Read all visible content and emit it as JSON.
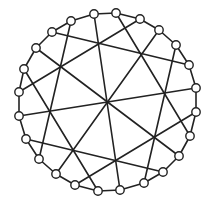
{
  "diagram": {
    "type": "circular-graph",
    "colors": {
      "stroke": "#222222",
      "node_fill": "#ffffff",
      "background": "#ffffff"
    },
    "node_radius": 4.2,
    "ring_nodes": [
      [
        94,
        14
      ],
      [
        116,
        13
      ],
      [
        140,
        19
      ],
      [
        159,
        30
      ],
      [
        176,
        45
      ],
      [
        189,
        65
      ],
      [
        196,
        88
      ],
      [
        196,
        112
      ],
      [
        190,
        136
      ],
      [
        179,
        156
      ],
      [
        163,
        172
      ],
      [
        144,
        183
      ],
      [
        120,
        190
      ],
      [
        98,
        191
      ],
      [
        75,
        185
      ],
      [
        56,
        174
      ],
      [
        39,
        159
      ],
      [
        26,
        139
      ],
      [
        19,
        116
      ],
      [
        19,
        92
      ],
      [
        24,
        69
      ],
      [
        36,
        48
      ],
      [
        52,
        32
      ],
      [
        71,
        21
      ]
    ],
    "chords": [
      [
        0,
        12
      ],
      [
        1,
        8
      ],
      [
        23,
        16
      ],
      [
        2,
        19
      ],
      [
        21,
        9
      ],
      [
        3,
        15
      ],
      [
        18,
        6
      ],
      [
        20,
        13
      ],
      [
        4,
        11
      ],
      [
        17,
        10
      ],
      [
        22,
        5
      ],
      [
        7,
        14
      ]
    ]
  }
}
